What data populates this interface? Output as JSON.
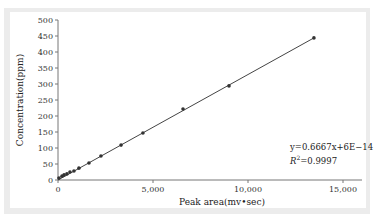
{
  "chart_data": {
    "type": "scatter",
    "title": "",
    "xlabel": "Peak area(mv•sec)",
    "ylabel": "Concentration(ppm)",
    "xlim": [
      0,
      16000
    ],
    "ylim": [
      0,
      500
    ],
    "x_ticks": [
      "0",
      "5,000",
      "10,000",
      "15,000"
    ],
    "x_tick_values": [
      0,
      5000,
      10000,
      15000
    ],
    "y_ticks": [
      "0",
      "50",
      "100",
      "150",
      "200",
      "250",
      "300",
      "350",
      "400",
      "450",
      "500"
    ],
    "y_tick_values": [
      0,
      50,
      100,
      150,
      200,
      250,
      300,
      350,
      400,
      450,
      500
    ],
    "grid": false,
    "legend": null,
    "series": [
      {
        "name": "Measured",
        "x": [
          50,
          210,
          320,
          470,
          630,
          840,
          1100,
          1630,
          2260,
          3320,
          4470,
          6580,
          9000,
          13470
        ],
        "y": [
          6,
          12,
          16,
          19,
          25,
          28,
          37,
          53,
          75,
          109,
          147,
          222,
          294,
          444
        ]
      }
    ],
    "trendline": {
      "type": "linear",
      "x": [
        0,
        13470
      ],
      "y": [
        0,
        444
      ]
    },
    "annotations": {
      "equation": "y=0.6667x+6E−14",
      "r2_label": "R",
      "r2_sup": "2",
      "r2_value": "=0.9997"
    }
  }
}
